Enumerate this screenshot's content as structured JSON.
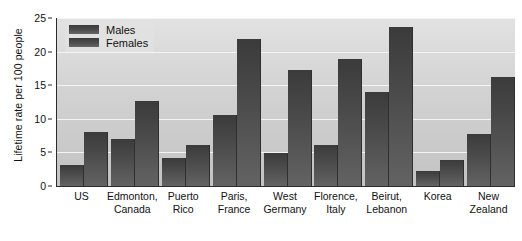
{
  "chart_data": {
    "type": "bar",
    "title": "",
    "xlabel": "",
    "ylabel": "Lifetime rate per 100 people",
    "ylim": [
      0,
      25
    ],
    "yticks": [
      0,
      5,
      10,
      15,
      20,
      25
    ],
    "grid": true,
    "legend_position": "top-left",
    "categories": [
      "US",
      "Edmonton, Canada",
      "Puerto Rico",
      "Paris, France",
      "West Germany",
      "Florence, Italy",
      "Beirut, Lebanon",
      "Korea",
      "New Zealand"
    ],
    "category_lines": [
      [
        "US",
        ""
      ],
      [
        "Edmonton,",
        "Canada"
      ],
      [
        "Puerto",
        "Rico"
      ],
      [
        "Paris,",
        "France"
      ],
      [
        "West",
        "Germany"
      ],
      [
        "Florence,",
        "Italy"
      ],
      [
        "Beirut,",
        "Lebanon"
      ],
      [
        "Korea",
        ""
      ],
      [
        "New",
        "Zealand"
      ]
    ],
    "series": [
      {
        "name": "Males",
        "values": [
          3.1,
          7.0,
          4.1,
          10.5,
          4.9,
          6.1,
          14.0,
          2.2,
          7.8
        ]
      },
      {
        "name": "Females",
        "values": [
          8.1,
          12.6,
          6.1,
          21.9,
          17.2,
          18.9,
          23.7,
          3.8,
          16.2
        ]
      }
    ]
  },
  "legend": {
    "items": [
      {
        "label": "Males"
      },
      {
        "label": "Females"
      }
    ]
  },
  "colors": {
    "bar": "#4a4a4a",
    "plot_background": "#d4d4d4",
    "gridline": "#f4f4f4",
    "axis": "#2b2b2b",
    "text": "#111111"
  }
}
